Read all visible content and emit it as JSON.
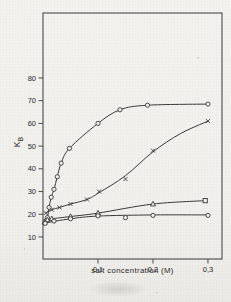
{
  "figure": {
    "background_color": "#f2f1ee",
    "line_color": "#3a3a3a",
    "text_color": "#2b2b2b"
  },
  "chart_data": {
    "type": "line",
    "title": "",
    "xlabel": "salt concentration (M)",
    "ylabel_main": "K",
    "ylabel_sub": "B",
    "grid": false,
    "legend": false,
    "xlim": [
      0,
      0.3255
    ],
    "ylim": [
      0.3,
      108.6
    ],
    "x_ticks": [
      {
        "value": 0.1,
        "label": "0,1"
      },
      {
        "value": 0.2,
        "label": "0,2"
      },
      {
        "value": 0.3,
        "label": "0,3"
      }
    ],
    "y_ticks": [
      {
        "value": 10,
        "label": "10"
      },
      {
        "value": 20,
        "label": "20"
      },
      {
        "value": 30,
        "label": "30"
      },
      {
        "value": 40,
        "label": "40"
      },
      {
        "value": 50,
        "label": "50"
      },
      {
        "value": 60,
        "label": "60"
      },
      {
        "value": 70,
        "label": "70"
      },
      {
        "value": 80,
        "label": "80"
      }
    ],
    "series": [
      {
        "name": "high-affinity-circles",
        "marker": "circle",
        "points": [
          [
            0.004,
            17
          ],
          [
            0.008,
            18.5
          ],
          [
            0.011,
            23
          ],
          [
            0.015,
            27.5
          ],
          [
            0.02,
            31
          ],
          [
            0.026,
            36.5
          ],
          [
            0.033,
            42.5
          ],
          [
            0.048,
            49
          ],
          [
            0.1,
            60
          ],
          [
            0.14,
            66
          ],
          [
            0.19,
            68
          ],
          [
            0.3,
            68.5
          ]
        ]
      },
      {
        "name": "sigmoid-crosses",
        "marker": "x",
        "points": [
          [
            0.005,
            20.5
          ],
          [
            0.016,
            22
          ],
          [
            0.03,
            23
          ],
          [
            0.05,
            24.5
          ],
          [
            0.08,
            26.5
          ],
          [
            0.102,
            30
          ],
          [
            0.15,
            35.5
          ],
          [
            0.2,
            48
          ],
          [
            0.3,
            61
          ]
        ],
        "line_points": [
          [
            0.005,
            20.5
          ],
          [
            0.016,
            22
          ],
          [
            0.03,
            23
          ],
          [
            0.05,
            24.5
          ],
          [
            0.08,
            26.5
          ],
          [
            0.102,
            29.5
          ],
          [
            0.15,
            37
          ],
          [
            0.2,
            47.5
          ],
          [
            0.25,
            55.5
          ],
          [
            0.3,
            61
          ]
        ]
      },
      {
        "name": "triangles-to-square",
        "marker": "triangle",
        "markers": [
          "triangle",
          "triangle",
          "triangle",
          "triangle",
          "triangle",
          "triangle",
          "square"
        ],
        "points": [
          [
            0.003,
            16.5
          ],
          [
            0.008,
            17.5
          ],
          [
            0.016,
            18
          ],
          [
            0.05,
            19
          ],
          [
            0.1,
            20.5
          ],
          [
            0.2,
            24.5
          ],
          [
            0.295,
            26
          ]
        ]
      },
      {
        "name": "flat-circles",
        "marker": "circle",
        "points": [
          [
            0.004,
            16
          ],
          [
            0.02,
            17
          ],
          [
            0.05,
            18
          ],
          [
            0.1,
            19.3
          ],
          [
            0.15,
            18.5
          ],
          [
            0.2,
            19.5
          ],
          [
            0.3,
            19.5
          ]
        ],
        "line_points": [
          [
            0.004,
            16.2
          ],
          [
            0.05,
            18
          ],
          [
            0.1,
            19.2
          ],
          [
            0.2,
            19.7
          ],
          [
            0.3,
            19.7
          ]
        ]
      }
    ]
  }
}
